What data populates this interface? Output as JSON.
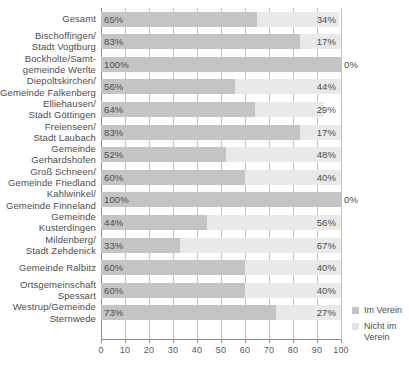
{
  "chart_data": {
    "type": "bar",
    "orientation": "horizontal",
    "stacked": true,
    "title": "",
    "xlabel": "",
    "ylabel": "",
    "xlim": [
      0,
      100
    ],
    "xticks": [
      0,
      10,
      20,
      30,
      40,
      50,
      60,
      70,
      80,
      90,
      100
    ],
    "grid": true,
    "legend_position": "right-bottom",
    "series": [
      {
        "name": "Im Verein",
        "color": "#c4c4c4",
        "values": [
          65,
          83,
          100,
          56,
          64,
          83,
          52,
          60,
          100,
          44,
          33,
          60,
          60,
          73
        ]
      },
      {
        "name": "Nicht im Verein",
        "color": "#e9e9e9",
        "values": [
          34,
          17,
          0,
          44,
          29,
          17,
          48,
          40,
          0,
          56,
          67,
          40,
          40,
          27
        ]
      }
    ],
    "categories": [
      "Gesamt",
      "Bischoffingen/ Stadt Vogtburg",
      "Bockholte/Samt- gemeinde Werlte",
      "Diepoltskirchen/ Gemeinde Falkenberg",
      "Elliehausen/ Stadt Göttingen",
      "Freienseen/ Stadt Laubach",
      "Gemeinde Gerhardshofen",
      "Groß Schneen/ Gemeinde Friedland",
      "Kahlwinkel/ Gemeinde Finneland",
      "Gemeinde Kusterdingen",
      "Mildenberg/ Stadt Zehdenick",
      "Gemeinde Ralbitz",
      "Ortsgemeinschaft Spessart",
      "Westrup/Gemeinde Sternwede"
    ],
    "rows": [
      {
        "category_lines": [
          "Gesamt"
        ],
        "left_label": "65%",
        "right_label": "34%",
        "im_verein": 65,
        "nicht_im_verein": 34
      },
      {
        "category_lines": [
          "Bischoffingen/",
          "Stadt Vogtburg"
        ],
        "left_label": "83%",
        "right_label": "17%",
        "im_verein": 83,
        "nicht_im_verein": 17
      },
      {
        "category_lines": [
          "Bockholte/Samt-",
          "gemeinde Werlte"
        ],
        "left_label": "100%",
        "right_label": "0%",
        "im_verein": 100,
        "nicht_im_verein": 0
      },
      {
        "category_lines": [
          "Diepoltskirchen/",
          "Gemeinde Falkenberg"
        ],
        "left_label": "56%",
        "right_label": "44%",
        "im_verein": 56,
        "nicht_im_verein": 44
      },
      {
        "category_lines": [
          "Elliehausen/",
          "Stadt Göttingen"
        ],
        "left_label": "64%",
        "right_label": "29%",
        "im_verein": 64,
        "nicht_im_verein": 29
      },
      {
        "category_lines": [
          "Freienseen/",
          "Stadt Laubach"
        ],
        "left_label": "83%",
        "right_label": "17%",
        "im_verein": 83,
        "nicht_im_verein": 17
      },
      {
        "category_lines": [
          "Gemeinde",
          "Gerhardshofen"
        ],
        "left_label": "52%",
        "right_label": "48%",
        "im_verein": 52,
        "nicht_im_verein": 48
      },
      {
        "category_lines": [
          "Groß Schneen/",
          "Gemeinde Friedland"
        ],
        "left_label": "60%",
        "right_label": "40%",
        "im_verein": 60,
        "nicht_im_verein": 40
      },
      {
        "category_lines": [
          "Kahlwinkel/",
          "Gemeinde Finneland"
        ],
        "left_label": "100%",
        "right_label": "0%",
        "im_verein": 100,
        "nicht_im_verein": 0
      },
      {
        "category_lines": [
          "Gemeinde",
          "Kusterdingen"
        ],
        "left_label": "44%",
        "right_label": "56%",
        "im_verein": 44,
        "nicht_im_verein": 56
      },
      {
        "category_lines": [
          "Mildenberg/",
          "Stadt Zehdenick"
        ],
        "left_label": "33%",
        "right_label": "67%",
        "im_verein": 33,
        "nicht_im_verein": 67
      },
      {
        "category_lines": [
          "Gemeinde Ralbitz"
        ],
        "left_label": "60%",
        "right_label": "40%",
        "im_verein": 60,
        "nicht_im_verein": 40
      },
      {
        "category_lines": [
          "Ortsgemeinschaft",
          "Spessart"
        ],
        "left_label": "60%",
        "right_label": "40%",
        "im_verein": 60,
        "nicht_im_verein": 40
      },
      {
        "category_lines": [
          "Westrup/Gemeinde",
          "Sternwede"
        ],
        "left_label": "73%",
        "right_label": "27%",
        "im_verein": 73,
        "nicht_im_verein": 27
      }
    ],
    "tick_labels": [
      "0",
      "10",
      "20",
      "30",
      "40",
      "50",
      "60",
      "70",
      "80",
      "90",
      "100"
    ],
    "legend": [
      {
        "label": "Im Verein",
        "color": "#c4c4c4"
      },
      {
        "label": "Nicht im Verein",
        "color": "#e4e4e4"
      }
    ]
  },
  "legend": {
    "item_0": "Im Verein",
    "item_1_line_0": "Nicht im",
    "item_1_line_1": "Verein"
  }
}
